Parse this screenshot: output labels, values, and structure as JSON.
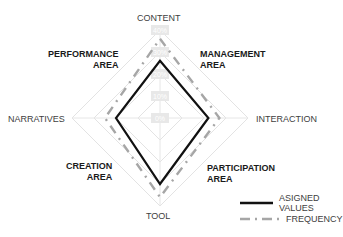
{
  "chart_data": {
    "type": "radar",
    "axes": [
      "CONTENT",
      "INTERACTION",
      "TOOL",
      "NARRATIVES"
    ],
    "tick_labels": [
      "0%",
      "10%",
      "20%",
      "30%",
      "40%"
    ],
    "range": [
      0,
      40
    ],
    "series": [
      {
        "name": "ASIGNED VALUES",
        "style": "solid",
        "color": "#111111",
        "values": [
          26,
          22,
          30,
          20
        ]
      },
      {
        "name": "FREQUENCY",
        "style": "dash-dot",
        "color": "#a6a6a6",
        "values": [
          36,
          27,
          36,
          25
        ]
      }
    ],
    "area_labels": [
      {
        "lines": [
          "PERFORMANCE",
          "AREA"
        ],
        "quadrant": "top-left"
      },
      {
        "lines": [
          "MANAGEMENT",
          "AREA"
        ],
        "quadrant": "top-right"
      },
      {
        "lines": [
          "CREATION",
          "AREA"
        ],
        "quadrant": "bottom-left"
      },
      {
        "lines": [
          "PARTICIPATION",
          "AREA"
        ],
        "quadrant": "bottom-right"
      }
    ],
    "legend_position": "bottom-right",
    "grid": true
  },
  "labels": {
    "content": "CONTENT",
    "interaction": "INTERACTION",
    "tool": "TOOL",
    "narratives": "NARRATIVES",
    "performance": [
      "PERFORMANCE",
      "AREA"
    ],
    "management": [
      "MANAGEMENT",
      "AREA"
    ],
    "creation": [
      "CREATION",
      "AREA"
    ],
    "participation": [
      "PARTICIPATION",
      "AREA"
    ]
  },
  "legend": {
    "assigned": "ASIGNED VALUES",
    "frequency": "FREQUENCY"
  }
}
